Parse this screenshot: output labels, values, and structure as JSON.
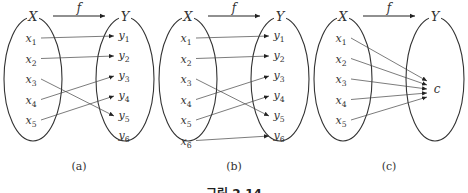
{
  "figure": {
    "caption": "그림 2.14",
    "function_label": "f",
    "domain_label": "X",
    "codomain_label": "Y"
  },
  "panels": [
    {
      "id": "a",
      "label": "(a)",
      "domain": [
        "x1",
        "x2",
        "x3",
        "x4",
        "x5"
      ],
      "codomain": [
        "y1",
        "y2",
        "y3",
        "y4",
        "y5",
        "y6"
      ],
      "mapping": [
        [
          "x1",
          "y1"
        ],
        [
          "x2",
          "y2"
        ],
        [
          "x3",
          "y5"
        ],
        [
          "x4",
          "y3"
        ],
        [
          "x5",
          "y4"
        ]
      ]
    },
    {
      "id": "b",
      "label": "(b)",
      "domain": [
        "x1",
        "x2",
        "x3",
        "x4",
        "x5",
        "x6"
      ],
      "codomain": [
        "y1",
        "y2",
        "y3",
        "y4",
        "y5",
        "y6"
      ],
      "mapping": [
        [
          "x1",
          "y1"
        ],
        [
          "x2",
          "y2"
        ],
        [
          "x3",
          "y5"
        ],
        [
          "x4",
          "y3"
        ],
        [
          "x5",
          "y4"
        ],
        [
          "x6",
          "y6"
        ]
      ]
    },
    {
      "id": "c",
      "label": "(c)",
      "domain": [
        "x1",
        "x2",
        "x3",
        "x4",
        "x5"
      ],
      "codomain": [
        "c"
      ],
      "mapping": [
        [
          "x1",
          "c"
        ],
        [
          "x2",
          "c"
        ],
        [
          "x3",
          "c"
        ],
        [
          "x4",
          "c"
        ],
        [
          "x5",
          "c"
        ]
      ]
    }
  ]
}
